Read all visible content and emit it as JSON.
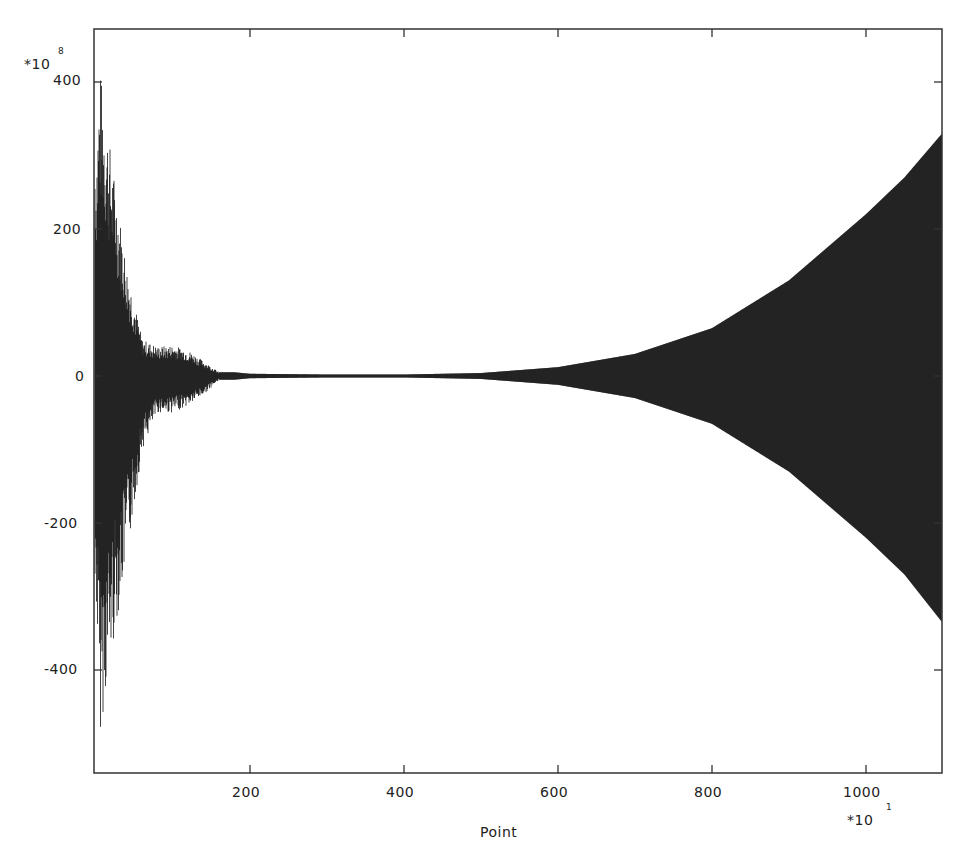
{
  "chart_data": {
    "type": "line",
    "title": "",
    "xlabel": "Point",
    "ylabel": "",
    "x_multiplier": "*10",
    "x_multiplier_exponent": "1",
    "y_multiplier": "*10",
    "y_multiplier_exponent": "8",
    "xlim": [
      0,
      1099
    ],
    "ylim": [
      -540,
      400
    ],
    "x_ticks": [
      200,
      400,
      600,
      800,
      1000
    ],
    "x_tick_labels": [
      "200",
      "400",
      "600",
      "800",
      "1000"
    ],
    "y_ticks": [
      400,
      200,
      0,
      -200,
      -400
    ],
    "y_tick_labels": [
      "400",
      "200",
      "0",
      "-200",
      "-400"
    ],
    "grid": false,
    "legend": null,
    "series": [
      {
        "name": "signal",
        "description": "Dense oscillating waveform; large decaying transient at start, near-zero in the middle, exponentially growing envelope toward the end",
        "envelope_x": [
          0,
          5,
          20,
          40,
          60,
          80,
          100,
          120,
          140,
          160,
          180,
          200,
          300,
          400,
          500,
          600,
          700,
          800,
          900,
          1000,
          1050,
          1099
        ],
        "envelope_upper": [
          300,
          420,
          300,
          150,
          50,
          40,
          42,
          35,
          20,
          5,
          5,
          3,
          2,
          2,
          4,
          12,
          30,
          65,
          130,
          220,
          270,
          330
        ],
        "envelope_lower": [
          -300,
          -490,
          -380,
          -250,
          -100,
          -50,
          -50,
          -40,
          -25,
          -5,
          -5,
          -3,
          -2,
          -2,
          -4,
          -12,
          -30,
          -65,
          -130,
          -220,
          -270,
          -335
        ]
      }
    ]
  },
  "axes": {
    "xlabel": "Point",
    "x_exp_base": "*10",
    "x_exp": "1",
    "y_exp_base": "*10",
    "y_exp": "8",
    "x_tick_labels": [
      "200",
      "400",
      "600",
      "800",
      "1000"
    ],
    "y_tick_labels": [
      "400",
      "200",
      "0",
      "-200",
      "-400"
    ]
  },
  "colors": {
    "line": "#111111",
    "frame": "#333333",
    "background": "#ffffff"
  }
}
